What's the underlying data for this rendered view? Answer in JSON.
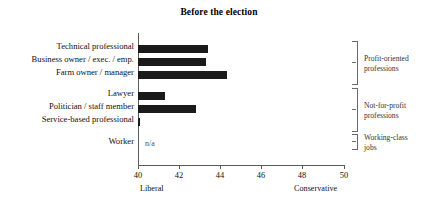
{
  "chart_data": {
    "type": "bar",
    "orientation": "horizontal",
    "title": "Before the election",
    "xlabel": "",
    "ylabel": "",
    "xlim": [
      40,
      50
    ],
    "xticks": [
      40,
      42,
      44,
      46,
      48,
      50
    ],
    "xtick_labels": [
      "40",
      "42",
      "44",
      "46",
      "48",
      "50"
    ],
    "axis_end_labels": {
      "low": "Liberal",
      "high": "Conservative"
    },
    "grid": false,
    "legend": "none",
    "bar_color": "#1a1a1a",
    "categories": [
      "Technical professional",
      "Business owner / exec. / emp.",
      "Farm owner / manager",
      "Lawyer",
      "Politician / staff member",
      "Service-based professional",
      "Worker"
    ],
    "values": [
      43.4,
      43.3,
      44.3,
      41.3,
      42.8,
      40.1,
      null
    ],
    "value_labels": [
      "",
      "",
      "",
      "",
      "",
      "",
      "n/a"
    ],
    "annotations": [
      {
        "text": "n/a",
        "category": "Worker"
      }
    ],
    "groups": [
      {
        "label_line1": "Profit-oriented",
        "label_line2": "professions",
        "members": [
          "Technical professional",
          "Business owner / exec. / emp.",
          "Farm owner / manager"
        ]
      },
      {
        "label_line1": "Not-for-profit",
        "label_line2": "professions",
        "members": [
          "Lawyer",
          "Politician / staff member",
          "Service-based professional"
        ]
      },
      {
        "label_line1": "Working-class",
        "label_line2": "jobs",
        "members": [
          "Worker"
        ]
      }
    ]
  },
  "chart": {
    "title": "Before the election",
    "bars": [
      {
        "label": "Technical professional",
        "value": 43.4,
        "left_px": 0,
        "width_px": 70,
        "top_px": 12
      },
      {
        "label": "Business owner / exec. / emp.",
        "value": 43.3,
        "left_px": 0,
        "width_px": 68,
        "top_px": 25
      },
      {
        "label": "Farm owner / manager",
        "value": 44.3,
        "left_px": 0,
        "width_px": 89,
        "top_px": 38
      },
      {
        "label": "Lawyer",
        "value": 41.3,
        "left_px": 0,
        "width_px": 27,
        "top_px": 59
      },
      {
        "label": "Politician / staff member",
        "value": 42.8,
        "left_px": 0,
        "width_px": 58,
        "top_px": 72
      },
      {
        "label": "Service-based professional",
        "value": 40.1,
        "left_px": 0,
        "width_px": 3,
        "top_px": 85
      },
      {
        "label": "Worker",
        "value": null,
        "left_px": 0,
        "width_px": 0,
        "top_px": 107
      }
    ],
    "na_label": "n/a",
    "ticks": [
      {
        "label": "40",
        "x_px": 138
      },
      {
        "label": "42",
        "x_px": 179
      },
      {
        "label": "44",
        "x_px": 220
      },
      {
        "label": "46",
        "x_px": 261
      },
      {
        "label": "48",
        "x_px": 302
      },
      {
        "label": "50",
        "x_px": 344
      }
    ],
    "low_end_label": "Liberal",
    "high_end_label": "Conservative",
    "groups": [
      {
        "line1": "Profit-oriented",
        "line2": "professions"
      },
      {
        "line1": "Not-for-profit",
        "line2": "professions"
      },
      {
        "line1": "Working-class",
        "line2": "jobs"
      }
    ]
  }
}
